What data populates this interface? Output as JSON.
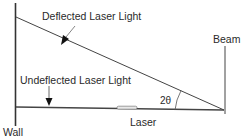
{
  "diagram": {
    "labels": {
      "deflected": "Deflected Laser Light",
      "undeflected": "Undeflected Laser Light",
      "beam": "Beam",
      "wall": "Wall",
      "laser": "Laser",
      "angle": "2θ"
    },
    "colors": {
      "line": "#333333",
      "text": "#2a2a2a",
      "background": "#ffffff"
    }
  }
}
